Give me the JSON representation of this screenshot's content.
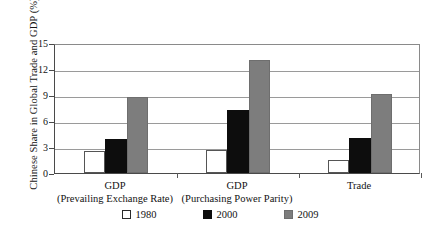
{
  "chart_data": {
    "type": "bar",
    "title": "",
    "xlabel": "",
    "ylabel": "Chinese Share in Global Trade and GDP (%)",
    "ylim": [
      0,
      15
    ],
    "yticks": [
      0,
      3,
      6,
      9,
      12,
      15
    ],
    "ytick_labels": [
      "0",
      "3",
      "6",
      "9",
      "12",
      "15"
    ],
    "grid": true,
    "legend_position": "bottom",
    "categories": [
      "GDP (Prevailing Exchange Rate)",
      "GDP (Purchasing Power Parity)",
      "Trade"
    ],
    "category_lines": [
      [
        "GDP",
        "(Prevailing Exchange Rate)"
      ],
      [
        "GDP",
        "(Purchasing Power Parity)"
      ],
      [
        "Trade",
        ""
      ]
    ],
    "series": [
      {
        "name": "1980",
        "color": "#ffffff",
        "values": [
          2.5,
          2.6,
          1.5
        ]
      },
      {
        "name": "2000",
        "color": "#0d0d0d",
        "values": [
          3.9,
          7.3,
          4.0
        ]
      },
      {
        "name": "2009",
        "color": "#7d7d7d",
        "values": [
          8.8,
          13.0,
          9.1
        ]
      }
    ]
  },
  "legend": {
    "items": [
      {
        "label": "1980",
        "swatch": "white-square-swatch"
      },
      {
        "label": "2000",
        "swatch": "black-square-swatch"
      },
      {
        "label": "2009",
        "swatch": "gray-square-swatch"
      }
    ]
  },
  "colors": {
    "series_1980": "#ffffff",
    "series_2000": "#0d0d0d",
    "series_2009": "#7d7d7d",
    "axis": "#4a4a4a",
    "gridline": "#9a9a9a",
    "background": "#ffffff",
    "text": "#121212"
  }
}
